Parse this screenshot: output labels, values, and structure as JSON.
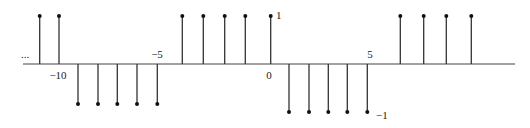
{
  "chart_data": {
    "type": "stem",
    "title": "",
    "xlabel": "",
    "ylabel": "",
    "x": [
      -11,
      -10,
      -9,
      -8,
      -7,
      -6,
      -5,
      -4,
      -3,
      -2,
      -1,
      0,
      1,
      2,
      3,
      4,
      5,
      6,
      7,
      8,
      9
    ],
    "values": [
      1,
      1,
      -1,
      -1,
      -1,
      -1,
      -1,
      1,
      1,
      1,
      1,
      1,
      -1,
      -1,
      -1,
      -1,
      -1,
      1,
      1,
      1,
      1
    ],
    "stem_px": [
      39.7,
      59,
      78,
      98,
      117.3,
      137,
      157.3,
      182.3,
      203.3,
      224.7,
      245.3,
      270.7,
      289,
      309,
      328.3,
      347.3,
      367.3,
      400.3,
      423.7,
      446.3,
      471.3
    ],
    "x_tick_labels": [
      {
        "text": "−10",
        "n": -10,
        "px": 58,
        "py": 79,
        "anchor": "middle"
      },
      {
        "text": "−5",
        "n": -5,
        "px": 157,
        "py": 58,
        "anchor": "middle"
      },
      {
        "text": "0",
        "n": 0,
        "px": 269,
        "py": 79,
        "anchor": "middle"
      },
      {
        "text": "5",
        "n": 5,
        "px": 370,
        "py": 58,
        "anchor": "middle"
      }
    ],
    "y_annotations": [
      {
        "text": "1",
        "px": 276,
        "py": 19,
        "anchor": "start"
      },
      {
        "text": "−1",
        "px": 376,
        "py": 119,
        "anchor": "start"
      }
    ],
    "ellipsis": {
      "text": "...",
      "px": 25,
      "py": 58
    },
    "ylim": [
      -1,
      1
    ],
    "grid": false,
    "legend": null,
    "axis": {
      "y_px": 64,
      "x_start_px": 23,
      "x_end_px": 515
    },
    "top_dot_y_px": 16,
    "bottom_dot_y_px": [
      104,
      104,
      104,
      104,
      104,
      112,
      112,
      112,
      112,
      112
    ],
    "colors": {
      "stem": "#333333",
      "axis": "#444444",
      "dot": "#111111"
    }
  }
}
